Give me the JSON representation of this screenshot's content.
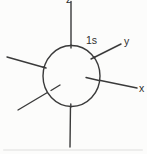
{
  "diagram": {
    "description_labels": {
      "orbital": "1s",
      "axis_z": "z",
      "axis_y": "y",
      "axis_x": "x"
    },
    "colors": {
      "line": "#3a3a3a",
      "text": "#2f2f2f",
      "background": "#fcfcfb"
    }
  }
}
